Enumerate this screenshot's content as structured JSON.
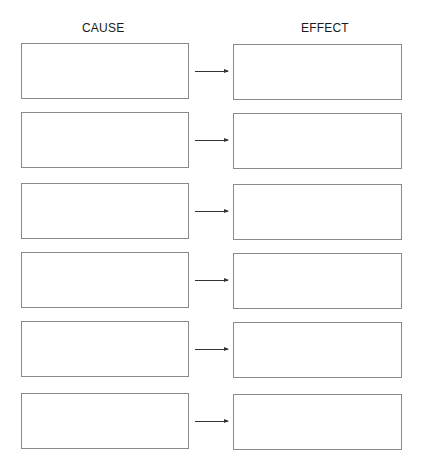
{
  "headers": {
    "cause": "CAUSE",
    "effect": "EFFECT"
  },
  "rows": [
    {
      "top": 43,
      "cause_text": "",
      "effect_text": ""
    },
    {
      "top": 112,
      "cause_text": "",
      "effect_text": ""
    },
    {
      "top": 183,
      "cause_text": "",
      "effect_text": ""
    },
    {
      "top": 252,
      "cause_text": "",
      "effect_text": ""
    },
    {
      "top": 321,
      "cause_text": "",
      "effect_text": ""
    },
    {
      "top": 393,
      "cause_text": "",
      "effect_text": ""
    }
  ],
  "colors": {
    "border": "#8a8a8a",
    "arrow": "#333333",
    "text": "#1a1a1a"
  }
}
